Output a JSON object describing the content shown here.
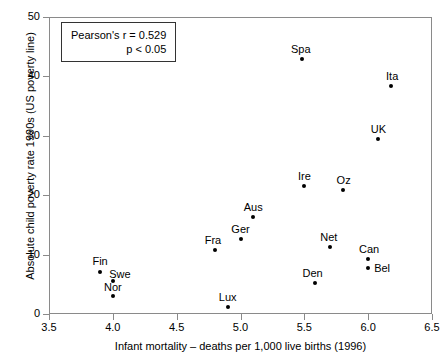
{
  "chart_data": {
    "type": "scatter",
    "title": "",
    "xlabel": "Infant mortality – deaths per 1,000 live births (1996)",
    "ylabel": "Absolute child poverty rate 1990s (US poverty line)",
    "xlim": [
      3.5,
      6.5
    ],
    "ylim": [
      0,
      50
    ],
    "xticks": [
      "3.5",
      "4.0",
      "4.5",
      "5.0",
      "5.5",
      "6.0",
      "6.5"
    ],
    "xtick_values": [
      3.5,
      4.0,
      4.5,
      5.0,
      5.5,
      6.0,
      6.5
    ],
    "yticks": [
      "0",
      "10",
      "20",
      "30",
      "40",
      "50"
    ],
    "ytick_values": [
      0,
      10,
      20,
      30,
      40,
      50
    ],
    "grid": false,
    "legend": "none",
    "marker_color": "#000000",
    "frame_color": "#8a8a8a",
    "points": [
      {
        "label": "Fin",
        "x": 3.9,
        "y": 7.0,
        "label_dx": -2,
        "label_dy": -16
      },
      {
        "label": "Swe",
        "x": 4.0,
        "y": 5.6,
        "label_dx": 5,
        "label_dy": -12
      },
      {
        "label": "Nor",
        "x": 4.0,
        "y": 3.0,
        "label_dx": -2,
        "label_dy": -14
      },
      {
        "label": "Lux",
        "x": 4.9,
        "y": 1.2,
        "label_dx": -2,
        "label_dy": -15
      },
      {
        "label": "Fra",
        "x": 4.8,
        "y": 10.8,
        "label_dx": -4,
        "label_dy": -15
      },
      {
        "label": "Ger",
        "x": 5.0,
        "y": 12.7,
        "label_dx": -2,
        "label_dy": -15
      },
      {
        "label": "Aus",
        "x": 5.1,
        "y": 16.4,
        "label_dx": -2,
        "label_dy": -15
      },
      {
        "label": "Spa",
        "x": 5.48,
        "y": 43.0,
        "label_dx": -3,
        "label_dy": -15
      },
      {
        "label": "Ire",
        "x": 5.5,
        "y": 21.6,
        "label_dx": -2,
        "label_dy": -15
      },
      {
        "label": "Den",
        "x": 5.58,
        "y": 5.2,
        "label_dx": -4,
        "label_dy": -15
      },
      {
        "label": "Oz",
        "x": 5.8,
        "y": 20.9,
        "label_dx": -1,
        "label_dy": -15
      },
      {
        "label": "Net",
        "x": 5.7,
        "y": 11.3,
        "label_dx": -3,
        "label_dy": -15
      },
      {
        "label": "Can",
        "x": 6.0,
        "y": 9.3,
        "label_dx": -1,
        "label_dy": -15
      },
      {
        "label": "Bel",
        "x": 6.0,
        "y": 7.8,
        "label_dx": 6,
        "label_dy": -5
      },
      {
        "label": "UK",
        "x": 6.08,
        "y": 29.4,
        "label_dx": -2,
        "label_dy": -15
      },
      {
        "label": "Ita",
        "x": 6.18,
        "y": 38.4,
        "label_dx": -1,
        "label_dy": -15
      }
    ],
    "annotations": {
      "stats_box": {
        "line1": "Pearson's r = 0.529",
        "line2": "p < 0.05"
      }
    }
  }
}
